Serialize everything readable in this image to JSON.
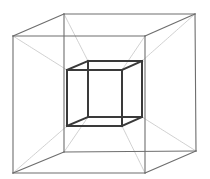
{
  "figure": {
    "width": 210,
    "height": 179,
    "colors": {
      "background": "#ffffff",
      "outer_cube_edges": "#6e6e6e",
      "inner_cube_edges": "#3a3a3a",
      "connector_edges": "#c4c4c4"
    },
    "stroke_widths": {
      "outer": 1.1,
      "inner": 2.0,
      "connector": 0.8
    },
    "outer_cube": {
      "front": [
        [
          13,
          36
        ],
        [
          145,
          36
        ],
        [
          145,
          173
        ],
        [
          13,
          173
        ]
      ],
      "back": [
        [
          64,
          14
        ],
        [
          195,
          14
        ],
        [
          196,
          151
        ],
        [
          64,
          152
        ]
      ]
    },
    "inner_cube": {
      "front": [
        [
          67,
          70
        ],
        [
          122,
          70
        ],
        [
          122,
          126
        ],
        [
          67,
          126
        ]
      ],
      "back": [
        [
          88,
          61
        ],
        [
          142,
          61
        ],
        [
          142,
          117
        ],
        [
          88,
          117
        ]
      ]
    }
  }
}
